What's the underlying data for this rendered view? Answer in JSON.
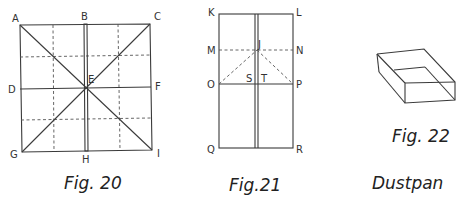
{
  "figures": [
    {
      "id": "fig20",
      "caption": "Fig. 20",
      "labels": {
        "A": "A",
        "B": "B",
        "C": "C",
        "D": "D",
        "E": "E",
        "F": "F",
        "G": "G",
        "H": "H",
        "I": "I"
      }
    },
    {
      "id": "fig21",
      "caption": "Fig.21",
      "labels": {
        "K": "K",
        "L": "L",
        "M": "M",
        "N": "N",
        "J": "J",
        "O": "O",
        "S": "S",
        "T": "T",
        "P": "P",
        "Q": "Q",
        "R": "R"
      }
    },
    {
      "id": "fig22",
      "caption": "Fig. 22",
      "title": "Dustpan"
    }
  ],
  "colors": {
    "line": "#3a3a3a",
    "text": "#222222",
    "background": "#ffffff"
  }
}
